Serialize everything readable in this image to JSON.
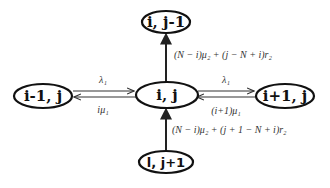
{
  "diagram": {
    "title": "",
    "nodes": [
      {
        "id": "top",
        "label": "i, j-1",
        "cx": 166,
        "cy": 22,
        "rx": 24,
        "ry": 11
      },
      {
        "id": "center",
        "label": "i, j",
        "cx": 167,
        "cy": 95,
        "rx": 31,
        "ry": 13
      },
      {
        "id": "left",
        "label": "i-1, j",
        "cx": 43,
        "cy": 96,
        "rx": 29,
        "ry": 12
      },
      {
        "id": "right",
        "label": "i+1, j",
        "cx": 285,
        "cy": 96,
        "rx": 29,
        "ry": 12
      },
      {
        "id": "bottom",
        "label": "l, j+1",
        "cx": 166,
        "cy": 162,
        "rx": 27,
        "ry": 11
      }
    ],
    "edges": [
      {
        "from": "center",
        "to": "top",
        "label": "(N − i)μ₂ + (j − N + i)r₂"
      },
      {
        "from": "left",
        "to": "center",
        "label": "λ₁"
      },
      {
        "from": "center",
        "to": "left",
        "label": "iμ₁"
      },
      {
        "from": "center",
        "to": "right",
        "label": "λ₁"
      },
      {
        "from": "right",
        "to": "center",
        "label": "(i+1)μ₁"
      },
      {
        "from": "bottom",
        "to": "center",
        "label": "(N − i)μ₂ + (j + 1 − N + i)r₂"
      }
    ]
  },
  "labels": {
    "node_top": "i, j-1",
    "node_center": "i, j",
    "node_left": "i-1, j",
    "node_right": "i+1, j",
    "node_bottom": "l, j+1",
    "edge_up_top": "(N − i)μ₂ + (j − N + i)r₂",
    "edge_left_forward": "λ₁",
    "edge_left_back": "iμ₁",
    "edge_right_forward": "λ₁",
    "edge_right_back": "(i+1)μ₁",
    "edge_up_bottom": "(N − i)μ₂ + (j + 1 − N + i)r₂"
  },
  "colors": {
    "stroke": "#111111",
    "text": "#111111",
    "edge_text": "#333333",
    "background": "#ffffff"
  }
}
